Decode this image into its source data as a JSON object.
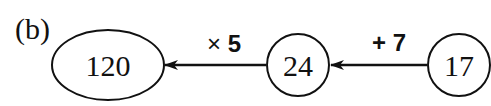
{
  "label": "(b)",
  "nodes": [
    {
      "id": "result",
      "value": "120",
      "shape": "ellipse"
    },
    {
      "id": "middle",
      "value": "24",
      "shape": "circle"
    },
    {
      "id": "start",
      "value": "17",
      "shape": "circle"
    }
  ],
  "edges": [
    {
      "from": "start",
      "to": "middle",
      "op_symbol": "+",
      "op_value": "7"
    },
    {
      "from": "middle",
      "to": "result",
      "op_symbol": "×",
      "op_value": "5"
    }
  ]
}
